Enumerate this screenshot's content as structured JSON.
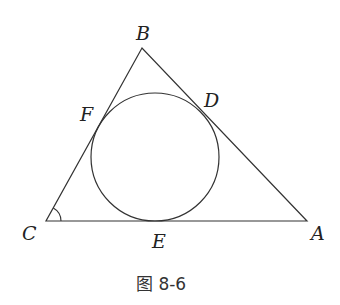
{
  "figure": {
    "caption": "图 8-6",
    "points": {
      "A": {
        "label": "A",
        "x": 307,
        "y": 221
      },
      "B": {
        "label": "B",
        "x": 142,
        "y": 48
      },
      "C": {
        "label": "C",
        "x": 46,
        "y": 221
      },
      "D": {
        "label": "D"
      },
      "E": {
        "label": "E"
      },
      "F": {
        "label": "F"
      }
    },
    "incircle": {
      "cx": 155,
      "cy": 157,
      "r": 64
    },
    "angle_mark": "C",
    "stroke_color": "#333333"
  }
}
